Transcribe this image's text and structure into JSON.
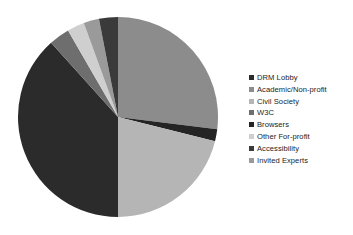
{
  "chart_data": {
    "type": "pie",
    "title": "",
    "legend_position": "right",
    "grid": false,
    "start_angle_deg": 0,
    "direction": "clockwise",
    "categories": [
      "DRM Lobby",
      "Academic/Non-profit",
      "Civil Society",
      "W3C",
      "Browsers",
      "Other For-profit",
      "Accessibility",
      "Invited Experts"
    ],
    "values": [
      38.3,
      27.0,
      21.1,
      3.3,
      2.0,
      2.8,
      3.0,
      2.5
    ],
    "colors": [
      "#2b2b2b",
      "#8c8c8c",
      "#b5b5b5",
      "#6e6e6e",
      "#242424",
      "#cfcfcf",
      "#3a3a3a",
      "#9a9a9a"
    ],
    "slices": [
      {
        "label": "Academic/Non-profit",
        "value": 27.0,
        "color": "#8c8c8c",
        "start_deg": 0,
        "end_deg": 97
      },
      {
        "label": "Browsers",
        "value": 2.0,
        "color": "#242424",
        "start_deg": 97,
        "end_deg": 104
      },
      {
        "label": "Civil Society",
        "value": 21.1,
        "color": "#b5b5b5",
        "start_deg": 104,
        "end_deg": 180
      },
      {
        "label": "DRM Lobby",
        "value": 38.3,
        "color": "#2b2b2b",
        "start_deg": 180,
        "end_deg": 318
      },
      {
        "label": "W3C",
        "value": 3.3,
        "color": "#6e6e6e",
        "start_deg": 318,
        "end_deg": 330
      },
      {
        "label": "Other For-profit",
        "value": 2.8,
        "color": "#cfcfcf",
        "start_deg": 330,
        "end_deg": 340
      },
      {
        "label": "Invited Experts",
        "value": 2.5,
        "color": "#9a9a9a",
        "start_deg": 340,
        "end_deg": 349
      },
      {
        "label": "Accessibility",
        "value": 3.0,
        "color": "#3a3a3a",
        "start_deg": 349,
        "end_deg": 360
      }
    ]
  },
  "legend": {
    "items": [
      {
        "label": "DRM Lobby",
        "color": "#2b2b2b"
      },
      {
        "label": "Academic/Non-profit",
        "color": "#8c8c8c"
      },
      {
        "label": "Civil Society",
        "color": "#b5b5b5"
      },
      {
        "label": "W3C",
        "color": "#6e6e6e"
      },
      {
        "label": "Browsers",
        "color": "#242424"
      },
      {
        "label": "Other For-profit",
        "color": "#cfcfcf"
      },
      {
        "label": "Accessibility",
        "color": "#3a3a3a"
      },
      {
        "label": "Invited Experts",
        "color": "#9a9a9a"
      }
    ]
  }
}
